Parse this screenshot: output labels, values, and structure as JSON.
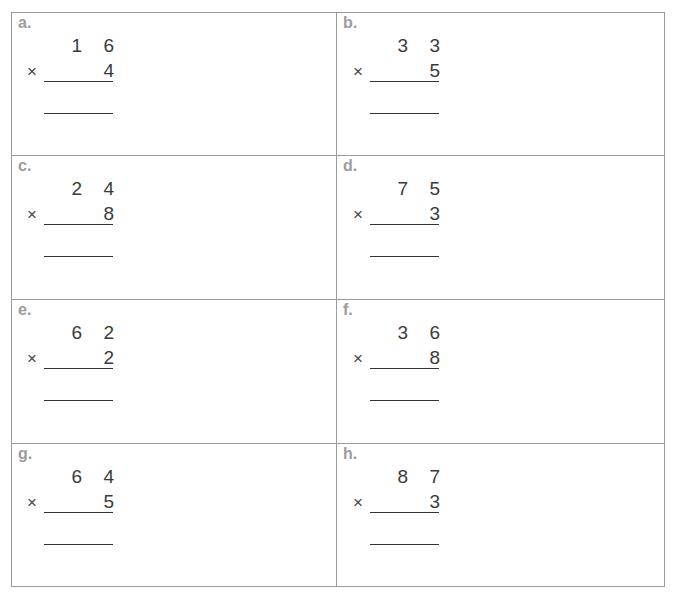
{
  "worksheet": {
    "problems": [
      {
        "label": "a.",
        "top": "1 6",
        "bottom": "4",
        "operator": "×"
      },
      {
        "label": "b.",
        "top": "3 3",
        "bottom": "5",
        "operator": "×"
      },
      {
        "label": "c.",
        "top": "2 4",
        "bottom": "8",
        "operator": "×"
      },
      {
        "label": "d.",
        "top": "7 5",
        "bottom": "3",
        "operator": "×"
      },
      {
        "label": "e.",
        "top": "6 2",
        "bottom": "2",
        "operator": "×"
      },
      {
        "label": "f.",
        "top": "3 6",
        "bottom": "8",
        "operator": "×"
      },
      {
        "label": "g.",
        "top": "6 4",
        "bottom": "5",
        "operator": "×"
      },
      {
        "label": "h.",
        "top": "8 7",
        "bottom": "3",
        "operator": "×"
      }
    ]
  },
  "colors": {
    "grid_line": "#9a9a9a",
    "label": "#9c9c9c",
    "digits": "#3a3a3a",
    "rule": "#333333"
  }
}
